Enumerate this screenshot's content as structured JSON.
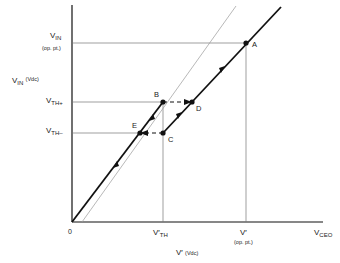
{
  "diagram": {
    "y_axis": {
      "label_main": "V",
      "label_sub": "IN",
      "label_unit": "(Vdc)",
      "ticks": [
        {
          "main": "V",
          "sub": "IN",
          "note": "(op. pt.)"
        },
        {
          "main": "V",
          "sub": "TH+"
        },
        {
          "main": "V",
          "sub": "TH–"
        }
      ]
    },
    "x_axis": {
      "label_main": "V′",
      "label_unit": "(Vdc)",
      "origin": "0",
      "ticks": [
        {
          "main": "V′",
          "sub": "TH"
        },
        {
          "main": "V′",
          "note": "(op. pt.)"
        },
        {
          "main": "V",
          "sub": "CEO"
        }
      ]
    },
    "points": [
      {
        "id": "A",
        "label": "A"
      },
      {
        "id": "B",
        "label": "B"
      },
      {
        "id": "C",
        "label": "C"
      },
      {
        "id": "D",
        "label": "D"
      },
      {
        "id": "E",
        "label": "E"
      }
    ],
    "colors": {
      "thick_line": "#111111",
      "thin_line": "#888888",
      "guide_line": "#777777"
    }
  }
}
